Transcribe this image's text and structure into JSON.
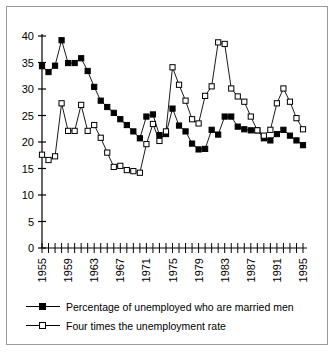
{
  "chart_data": {
    "type": "line",
    "title": "",
    "xlabel": "",
    "ylabel": "",
    "ylim": [
      0,
      40
    ],
    "ytick_values": [
      0,
      5,
      10,
      15,
      20,
      25,
      30,
      35,
      40
    ],
    "xlim": [
      1955,
      1995
    ],
    "xtick_labels": [
      "1955",
      "1959",
      "1963",
      "1967",
      "1971",
      "1975",
      "1979",
      "1983",
      "1987",
      "1991",
      "1995"
    ],
    "xtick_label_years": [
      1955,
      1959,
      1963,
      1967,
      1971,
      1975,
      1979,
      1983,
      1987,
      1991,
      1995
    ],
    "minor_ticks_every": 1,
    "grid": false,
    "legend_position": "below",
    "x": [
      1955,
      1956,
      1957,
      1958,
      1959,
      1960,
      1961,
      1962,
      1963,
      1964,
      1965,
      1966,
      1967,
      1968,
      1969,
      1970,
      1971,
      1972,
      1973,
      1974,
      1975,
      1976,
      1977,
      1978,
      1979,
      1980,
      1981,
      1982,
      1983,
      1984,
      1985,
      1986,
      1987,
      1988,
      1989,
      1990,
      1991,
      1992,
      1993,
      1994,
      1995
    ],
    "series": [
      {
        "name": "Percentage of unemployed who are married men",
        "marker": "filled-square",
        "color": "#000000",
        "values": [
          34.3,
          33.2,
          34.4,
          39.2,
          34.9,
          34.9,
          35.8,
          33.4,
          30.4,
          27.8,
          26.6,
          25.5,
          24.3,
          23.2,
          22.0,
          20.7,
          24.8,
          25.2,
          21.3,
          21.5,
          26.3,
          23.1,
          22.0,
          19.7,
          18.6,
          18.7,
          22.3,
          21.4,
          24.8,
          24.8,
          22.9,
          22.4,
          22.2,
          22.2,
          20.7,
          20.3,
          21.5,
          22.3,
          21.2,
          20.3,
          19.4
        ]
      },
      {
        "name": "Four times the unemployment rate",
        "marker": "hollow-square",
        "color": "#000000",
        "values": [
          17.6,
          16.6,
          17.3,
          27.3,
          22.1,
          22.1,
          27.0,
          22.1,
          23.2,
          20.8,
          18.0,
          15.3,
          15.5,
          14.7,
          14.5,
          14.2,
          19.6,
          23.4,
          20.2,
          22.0,
          34.1,
          30.8,
          27.8,
          24.3,
          23.5,
          28.7,
          30.5,
          38.8,
          38.5,
          30.1,
          28.6,
          27.6,
          24.8,
          22.2,
          21.2,
          22.3,
          27.3,
          30.1,
          27.6,
          24.5,
          22.4
        ]
      }
    ]
  },
  "legend": {
    "items": [
      {
        "label": "Percentage of unemployed who are married men",
        "marker": "filled-square"
      },
      {
        "label": "Four times the unemployment rate",
        "marker": "hollow-square"
      }
    ]
  }
}
